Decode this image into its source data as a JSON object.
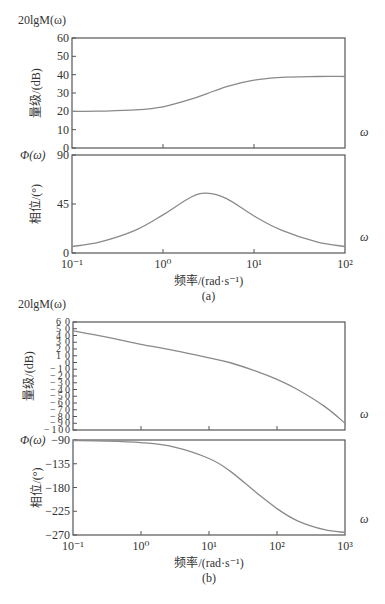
{
  "chart_data": [
    {
      "type": "line",
      "panel": "a",
      "subplot": "magnitude",
      "title": "",
      "corner_label": "20lgM(ω)",
      "xlabel": "频率/(rad·s⁻¹)",
      "ylabel": "量级/(dB)",
      "x_end_label": "ω",
      "xscale": "log",
      "xlim": [
        0.1,
        100
      ],
      "ylim": [
        0,
        60
      ],
      "yticks": [
        0,
        10,
        20,
        30,
        40,
        50,
        60
      ],
      "ytick_labels": [
        "0",
        "10",
        "20",
        "30",
        "40",
        "50",
        "60"
      ],
      "series": [
        {
          "name": "magnitude",
          "x": [
            0.1,
            0.2,
            0.5,
            1,
            2,
            3,
            5,
            10,
            20,
            50,
            100
          ],
          "y": [
            20,
            20.1,
            20.8,
            22.5,
            26.5,
            29.5,
            33.5,
            37,
            38.5,
            39,
            39
          ]
        }
      ]
    },
    {
      "type": "line",
      "panel": "a",
      "subplot": "phase",
      "corner_label": "Φ(ω)",
      "xlabel": "频率/(rad·s⁻¹)",
      "ylabel": "相位/(°)",
      "x_end_label": "ω",
      "xscale": "log",
      "xlim": [
        0.1,
        100
      ],
      "ylim": [
        0,
        90
      ],
      "yticks": [
        0,
        45,
        90
      ],
      "ytick_labels": [
        "0",
        "45",
        "90"
      ],
      "xticks": [
        0.1,
        1,
        10,
        100
      ],
      "xtick_labels": [
        "10⁻¹",
        "10⁰",
        "10¹",
        "10²"
      ],
      "series": [
        {
          "name": "phase",
          "x": [
            0.1,
            0.2,
            0.5,
            1,
            2,
            3,
            5,
            10,
            20,
            50,
            100
          ],
          "y": [
            6,
            10,
            21,
            35,
            51,
            55,
            50,
            34,
            21,
            10,
            6
          ]
        }
      ],
      "caption": "(a)"
    },
    {
      "type": "line",
      "panel": "b",
      "subplot": "magnitude",
      "corner_label": "20lgM(ω)",
      "xlabel": "频率/(rad·s⁻¹)",
      "ylabel": "量级/(dB)",
      "x_end_label": "ω",
      "xscale": "log",
      "xlim": [
        0.1,
        1000
      ],
      "ylim": [
        -100,
        60
      ],
      "yticks": [
        -100,
        -90,
        -80,
        -70,
        -60,
        -50,
        -40,
        -30,
        -20,
        -10,
        0,
        10,
        20,
        30,
        40,
        50,
        60
      ],
      "ytick_labels": [
        "-100",
        "-90",
        "-80",
        "-70",
        "-60",
        "-50",
        "-40",
        "-30",
        "-20",
        "-10",
        "0",
        "10",
        "20",
        "30",
        "40",
        "50",
        "60"
      ],
      "series": [
        {
          "name": "magnitude",
          "x": [
            0.1,
            0.3,
            1,
            3,
            10,
            20,
            50,
            100,
            200,
            500,
            1000
          ],
          "y": [
            47,
            38,
            27,
            18,
            7,
            0,
            -13,
            -25,
            -40,
            -65,
            -90
          ]
        }
      ]
    },
    {
      "type": "line",
      "panel": "b",
      "subplot": "phase",
      "corner_label": "Φ(ω)",
      "xlabel": "频率/(rad·s⁻¹)",
      "ylabel": "相位/(°)",
      "x_end_label": "ω",
      "xscale": "log",
      "xlim": [
        0.1,
        1000
      ],
      "ylim": [
        -270,
        -90
      ],
      "yticks": [
        -270,
        -225,
        -180,
        -135,
        -90
      ],
      "ytick_labels": [
        "-270",
        "-225",
        "-180",
        "-135",
        "-90"
      ],
      "xticks": [
        0.1,
        1,
        10,
        100,
        1000
      ],
      "xtick_labels": [
        "10⁻¹",
        "10⁰",
        "10¹",
        "10²",
        "10³"
      ],
      "series": [
        {
          "name": "phase",
          "x": [
            0.1,
            0.3,
            1,
            3,
            10,
            20,
            50,
            100,
            200,
            500,
            1000
          ],
          "y": [
            -91,
            -92,
            -95,
            -103,
            -125,
            -148,
            -190,
            -220,
            -243,
            -260,
            -265
          ]
        }
      ],
      "caption": "(b)"
    }
  ]
}
